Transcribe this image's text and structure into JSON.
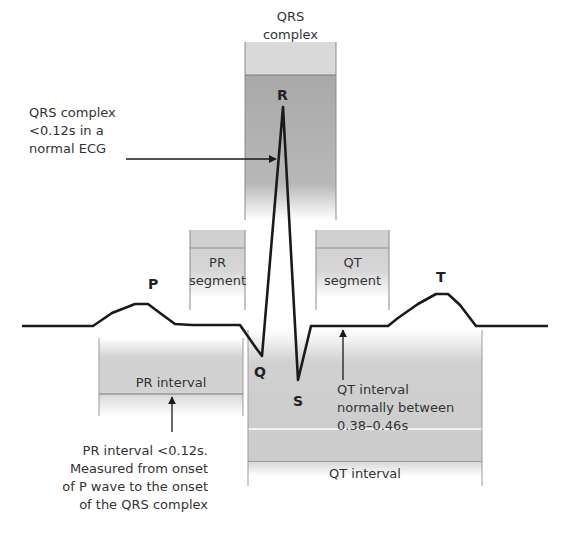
{
  "diagram": {
    "waves": {
      "P": "P",
      "Q": "Q",
      "R": "R",
      "S": "S",
      "T": "T"
    },
    "headers": {
      "qrs_complex_line1": "QRS",
      "qrs_complex_line2": "complex",
      "pr_segment_line1": "PR",
      "pr_segment_line2": "segment",
      "qt_segment_line1": "QT",
      "qt_segment_line2": "segment",
      "pr_interval": "PR interval",
      "qt_interval_bottom": "QT interval"
    },
    "annotations": {
      "qrs_note": [
        "QRS complex",
        "<0.12s in a",
        "normal ECG"
      ],
      "pr_note": [
        "PR interval <0.12s.",
        "Measured from onset",
        "of P wave to the onset",
        "of the QRS complex"
      ],
      "qt_note": [
        "QT interval",
        "normally between",
        "0.38–0.46s"
      ]
    },
    "colors": {
      "trace": "#1a1a1a",
      "box_fill": "#c8c8c8",
      "box_dark": "#a8a8a8",
      "border": "#7a7a7a"
    }
  }
}
